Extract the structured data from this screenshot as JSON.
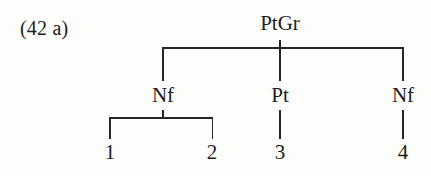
{
  "figure": {
    "example_label": "(42 a)",
    "type": "syntactic tree diagram",
    "background_color": "#fdfdfb",
    "line_color": "#262626",
    "text_color": "#1d1d1d"
  },
  "tree": {
    "root": {
      "label": "PtGr"
    },
    "level2": [
      {
        "label": "Nf"
      },
      {
        "label": "Pt"
      },
      {
        "label": "Nf"
      }
    ],
    "terminals": [
      {
        "label": "1"
      },
      {
        "label": "2"
      },
      {
        "label": "3"
      },
      {
        "label": "4"
      }
    ]
  }
}
